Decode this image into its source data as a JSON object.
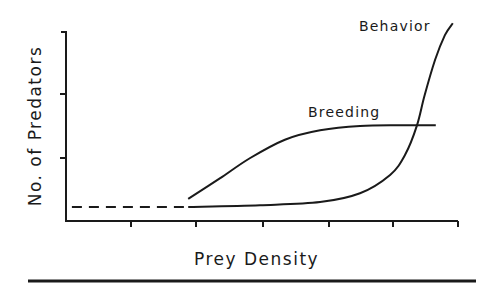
{
  "chart_data": {
    "type": "line",
    "title": "",
    "xlabel": "Prey Density",
    "ylabel": "No. of Predators",
    "x_ticks": 6,
    "y_ticks": 3,
    "tick_labels_shown": false,
    "xlim": [
      0,
      6
    ],
    "ylim": [
      0,
      3
    ],
    "grid": false,
    "legend": "inline curve labels",
    "series": [
      {
        "name": "Baseline",
        "style": "dashed",
        "x": [
          0.09,
          1.84
        ],
        "y": [
          0.22,
          0.22
        ]
      },
      {
        "name": "Behavior",
        "style": "solid",
        "x": [
          1.87,
          2.97,
          3.89,
          4.5,
          4.96,
          5.19,
          5.37,
          5.49,
          5.65,
          5.8,
          5.92
        ],
        "y": [
          0.22,
          0.25,
          0.3,
          0.44,
          0.73,
          1.05,
          1.51,
          2.0,
          2.56,
          2.95,
          3.14
        ]
      },
      {
        "name": "Breeding",
        "style": "solid",
        "x": [
          1.87,
          2.36,
          2.82,
          3.35,
          3.89,
          4.5,
          5.11,
          5.66
        ],
        "y": [
          0.35,
          0.68,
          1.0,
          1.29,
          1.44,
          1.51,
          1.52,
          1.52
        ]
      }
    ],
    "annotations": [
      {
        "text": "Behavior",
        "near": "top of Behavior curve"
      },
      {
        "text": "Breeding",
        "near": "plateau of Breeding curve"
      }
    ]
  },
  "labels": {
    "x_axis": "Prey Density",
    "y_axis": "No. of Predators",
    "behavior": "Behavior",
    "breeding": "Breeding"
  },
  "colors": {
    "ink": "#1a1a1a",
    "background": "#ffffff"
  }
}
